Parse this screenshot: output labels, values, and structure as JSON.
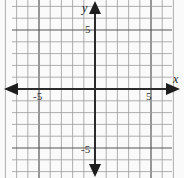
{
  "chart_data": {
    "type": "coordinate-grid",
    "title": "",
    "xlabel": "x",
    "ylabel": "y",
    "x_range": [
      -7,
      7
    ],
    "y_range": [
      -7,
      7
    ],
    "grid": true,
    "grid_step": 1,
    "major_step": 5,
    "tick_labels": {
      "x": [
        {
          "value": -5,
          "text": "-5"
        },
        {
          "value": 5,
          "text": "5"
        }
      ],
      "y": [
        {
          "value": 5,
          "text": "5"
        },
        {
          "value": -5,
          "text": "-5"
        }
      ]
    },
    "axes_arrows": true,
    "series": []
  },
  "labels": {
    "x_axis_name": "x",
    "y_axis_name": "y",
    "x_neg5": "-5",
    "x_pos5": "5",
    "y_pos5": "5",
    "y_neg5": "-5"
  },
  "colors": {
    "background": "#fafafa",
    "grid_minor": "#9a9a9a",
    "grid_major": "#555555",
    "axis": "#2a2a2a"
  }
}
